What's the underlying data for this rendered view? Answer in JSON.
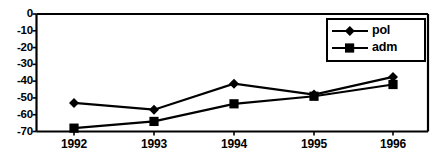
{
  "chart_data": {
    "type": "line",
    "title": "",
    "xlabel": "",
    "ylabel": "",
    "categories": [
      "1992",
      "1993",
      "1994",
      "1995",
      "1996"
    ],
    "ylim": [
      -70,
      0
    ],
    "yticks": [
      0,
      -10,
      -20,
      -30,
      -40,
      -50,
      -60,
      -70
    ],
    "ytick_labels": [
      "0",
      "-10",
      "-20",
      "-30",
      "-40",
      "-50",
      "-60",
      "-70"
    ],
    "grid": false,
    "legend_position": "top-right",
    "series": [
      {
        "name": "pol",
        "marker": "diamond",
        "color": "#000000",
        "values": [
          -53,
          -57,
          -41.5,
          -48,
          -37.5
        ]
      },
      {
        "name": "adm",
        "marker": "square",
        "color": "#000000",
        "values": [
          -68,
          -64,
          -53.5,
          -49,
          -42
        ]
      }
    ]
  },
  "legend": {
    "entries": [
      {
        "label": "pol",
        "marker": "diamond"
      },
      {
        "label": "adm",
        "marker": "square"
      }
    ]
  },
  "colors": {
    "axis": "#000000",
    "series_pol": "#000000",
    "series_adm": "#000000",
    "background": "#ffffff"
  }
}
